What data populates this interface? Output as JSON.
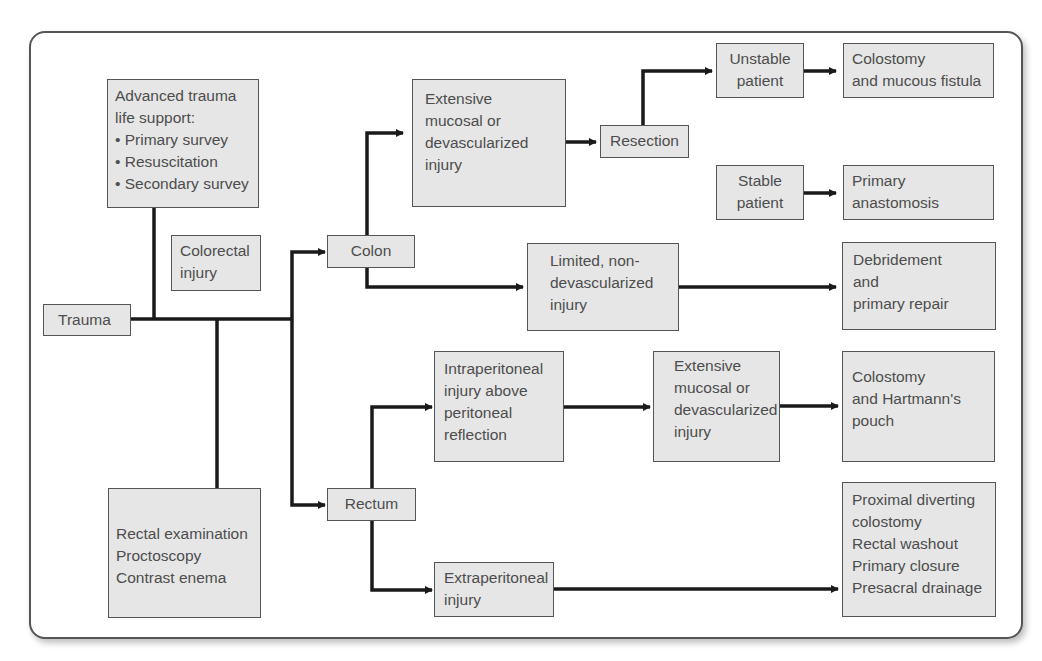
{
  "diagram": {
    "nodes": {
      "trauma": {
        "lines": [
          "Trauma"
        ]
      },
      "atls": {
        "lines": [
          "Advanced trauma",
          "life support:",
          "• Primary survey",
          "• Resuscitation",
          "• Secondary survey"
        ]
      },
      "colorectal": {
        "lines": [
          "Colorectal",
          "injury"
        ]
      },
      "exam": {
        "lines": [
          "Rectal examination",
          "Proctoscopy",
          "Contrast enema"
        ]
      },
      "colon": {
        "lines": [
          "Colon"
        ]
      },
      "rectum": {
        "lines": [
          "Rectum"
        ]
      },
      "colon_extensive": {
        "lines": [
          "Extensive",
          "mucosal or",
          "devascularized",
          "injury"
        ]
      },
      "resection": {
        "lines": [
          "Resection"
        ]
      },
      "unstable": {
        "lines": [
          "Unstable",
          "patient"
        ]
      },
      "colostomy_fistula": {
        "lines": [
          "Colostomy",
          "and mucous fistula"
        ]
      },
      "stable": {
        "lines": [
          "Stable",
          "patient"
        ]
      },
      "anastomosis": {
        "lines": [
          "Primary",
          "anastomosis"
        ]
      },
      "colon_limited": {
        "lines": [
          "Limited, non-",
          "devascularized",
          "injury"
        ]
      },
      "debridement": {
        "lines": [
          "Debridement",
          "and",
          "primary repair"
        ]
      },
      "intraperitoneal": {
        "lines": [
          "Intraperitoneal",
          "injury above",
          "peritoneal",
          "reflection"
        ]
      },
      "rectal_extensive": {
        "lines": [
          "Extensive",
          "mucosal or",
          "devascularized",
          "injury"
        ]
      },
      "hartmann": {
        "lines": [
          "Colostomy",
          "and Hartmann's",
          "pouch"
        ]
      },
      "extraperitoneal": {
        "lines": [
          "Extraperitoneal",
          "injury"
        ]
      },
      "diverting": {
        "lines": [
          "Proximal diverting",
          "colostomy",
          "Rectal washout",
          "Primary closure",
          "Presacral drainage"
        ]
      }
    },
    "edges": [
      [
        "trauma",
        "colon"
      ],
      [
        "trauma",
        "rectum"
      ],
      [
        "atls",
        "trauma"
      ],
      [
        "exam",
        "trauma"
      ],
      [
        "colon",
        "colon_extensive"
      ],
      [
        "colon",
        "colon_limited"
      ],
      [
        "colon_extensive",
        "resection"
      ],
      [
        "resection",
        "unstable"
      ],
      [
        "unstable",
        "colostomy_fistula"
      ],
      [
        "stable",
        "anastomosis"
      ],
      [
        "colon_limited",
        "debridement"
      ],
      [
        "rectum",
        "intraperitoneal"
      ],
      [
        "rectum",
        "extraperitoneal"
      ],
      [
        "intraperitoneal",
        "rectal_extensive"
      ],
      [
        "rectal_extensive",
        "hartmann"
      ],
      [
        "extraperitoneal",
        "diverting"
      ]
    ],
    "colors": {
      "box_fill": "#e6e6e6",
      "box_border": "#555555",
      "line": "#1a1a1a",
      "text": "#4d4d4d"
    }
  }
}
